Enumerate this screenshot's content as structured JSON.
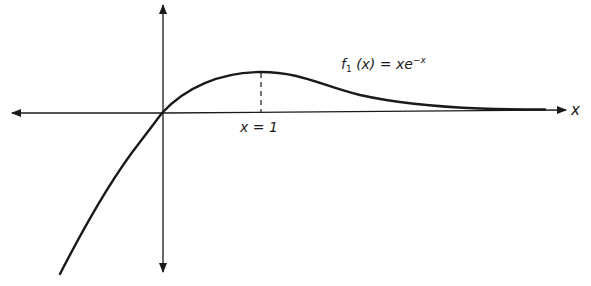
{
  "figure": {
    "function_label": {
      "name": "f",
      "subscript": "1",
      "argument": "(x)",
      "equals": "=",
      "expression_base": "xe",
      "expression_exponent": "−x"
    },
    "peak_marker_label": "x = 1",
    "x_axis_label": "x",
    "colors": {
      "ink": "#1a1a1a",
      "background": "#ffffff"
    }
  }
}
